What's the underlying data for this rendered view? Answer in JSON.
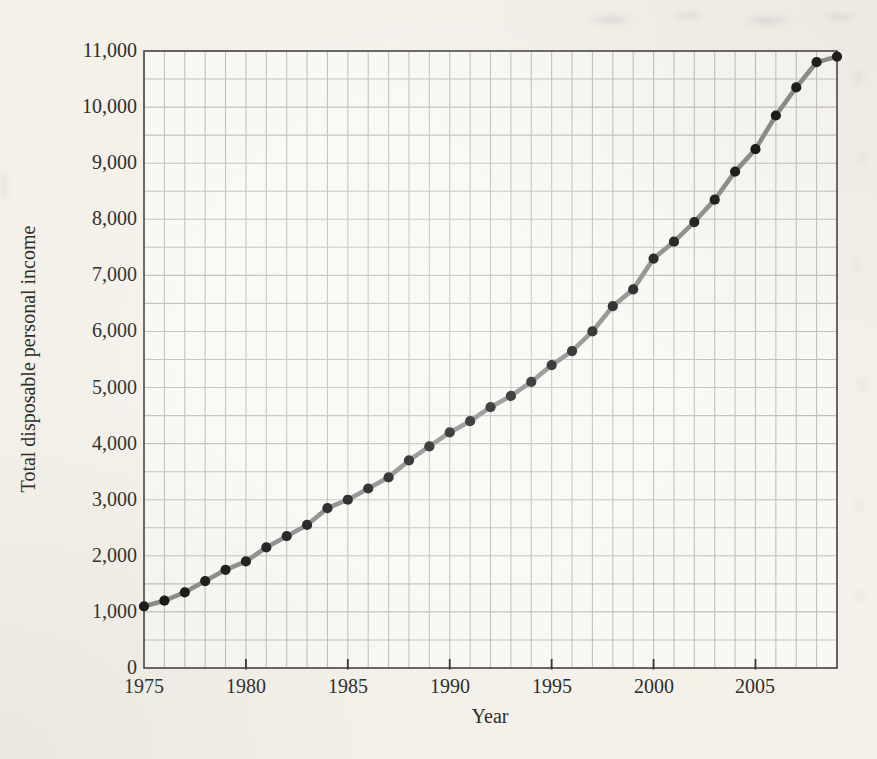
{
  "chart_data": {
    "type": "line",
    "title": "",
    "xlabel": "Year",
    "ylabel": "Total disposable personal income",
    "x": [
      1975,
      1976,
      1977,
      1978,
      1979,
      1980,
      1981,
      1982,
      1983,
      1984,
      1985,
      1986,
      1987,
      1988,
      1989,
      1990,
      1991,
      1992,
      1993,
      1994,
      1995,
      1996,
      1997,
      1998,
      1999,
      2000,
      2001,
      2002,
      2003,
      2004,
      2005,
      2006,
      2007,
      2008,
      2009
    ],
    "values": [
      1100,
      1200,
      1350,
      1550,
      1750,
      1900,
      2150,
      2350,
      2550,
      2850,
      3000,
      3200,
      3400,
      3700,
      3950,
      4200,
      4400,
      4650,
      4850,
      5100,
      5400,
      5650,
      6000,
      6450,
      6750,
      7300,
      7600,
      7950,
      8350,
      8850,
      9250,
      9850,
      10350,
      10800,
      10900
    ],
    "xlim": [
      1975,
      2009
    ],
    "ylim": [
      0,
      11000
    ],
    "x_tick_label_years": [
      1975,
      1980,
      1985,
      1990,
      1995,
      2000,
      2005
    ],
    "x_tick_labels": [
      "1975",
      "1980",
      "1985",
      "1990",
      "1995",
      "2000",
      "2005"
    ],
    "x_tick_mark_years": [
      1980,
      1985,
      1990,
      1995,
      2000,
      2005
    ],
    "y_ticks": [
      0,
      1000,
      2000,
      3000,
      4000,
      5000,
      6000,
      7000,
      8000,
      9000,
      10000,
      11000
    ],
    "y_tick_labels": [
      "0",
      "1,000",
      "2,000",
      "3,000",
      "4,000",
      "5,000",
      "6,000",
      "7,000",
      "8,000",
      "9,000",
      "10,000",
      "11,000"
    ],
    "x_grid_step": 1,
    "y_grid_step": 500,
    "grid": true,
    "legend": false,
    "marker": "filled-circle",
    "colors": {
      "line": "#8a8a8a",
      "marker": "#161616",
      "grid": "#c2c0ba",
      "axis_border": "#4d4c4a",
      "tick_mark": "#35342f",
      "plot_background": "#f9f8f4",
      "page_background": "#f3f1ea",
      "label_text": "#2e2d2a"
    }
  }
}
